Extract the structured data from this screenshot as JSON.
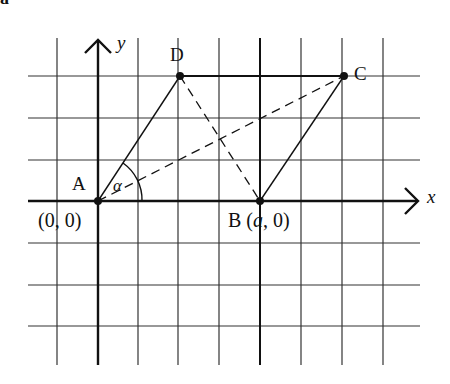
{
  "corner_label": "a",
  "axes": {
    "x_label": "x",
    "y_label": "y"
  },
  "points": {
    "A": {
      "label": "A",
      "coord_label": "(0, 0)"
    },
    "B": {
      "label": "B",
      "coord_prefix": "(",
      "coord_var": "a",
      "coord_suffix": ", 0)"
    },
    "C": {
      "label": "C"
    },
    "D": {
      "label": "D"
    }
  },
  "angle_label": "α",
  "colors": {
    "ink": "#111111",
    "grid": "#333333",
    "background": "#ffffff"
  }
}
